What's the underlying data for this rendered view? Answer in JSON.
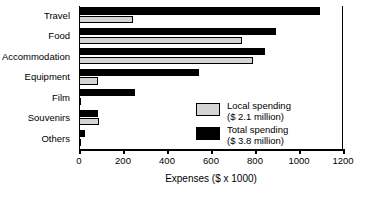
{
  "chart_data": {
    "type": "bar",
    "orientation": "horizontal",
    "title": "",
    "xlabel": "Expenses ($ x 1000)",
    "ylabel": "",
    "xlim": [
      0,
      1200
    ],
    "xticks": [
      0,
      200,
      400,
      600,
      800,
      1000,
      1200
    ],
    "xtick_labels": [
      "0",
      "200",
      "400",
      "600",
      "800",
      "1000",
      "1200"
    ],
    "grid": false,
    "legend_position": "inside-lower-right",
    "categories": [
      "Travel",
      "Food",
      "Accommodation",
      "Equipment",
      "Film",
      "Souvenirs",
      "Others"
    ],
    "series": [
      {
        "name": "Total spending",
        "legend_label": "Total spending",
        "legend_sublabel": "($ 3.8 million)",
        "color": "#000000",
        "values": [
          1095,
          895,
          845,
          545,
          255,
          85,
          25
        ]
      },
      {
        "name": "Local spending",
        "legend_label": "Local spending",
        "legend_sublabel": "($ 2.1 million)",
        "color": "#d4d4d4",
        "values": [
          245,
          740,
          790,
          85,
          10,
          90,
          5
        ]
      }
    ]
  },
  "axis": {
    "x_title": "Expenses ($ x 1000)"
  },
  "legend": {
    "items": [
      {
        "label": "Local spending",
        "sublabel": "($ 2.1 million)",
        "swatch": "grey-swatch-icon"
      },
      {
        "label": "Total spending",
        "sublabel": "($ 3.8 million)",
        "swatch": "black-swatch-icon"
      }
    ]
  }
}
